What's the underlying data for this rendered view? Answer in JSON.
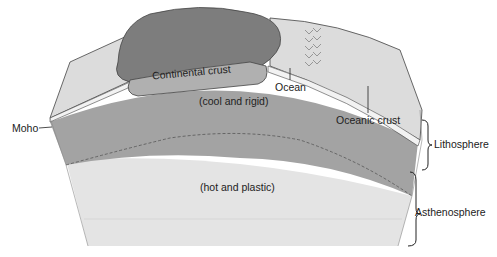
{
  "labels": {
    "continental_crust": "Continental crust",
    "ocean": "Ocean",
    "cool_rigid": "(cool and rigid)",
    "oceanic_crust": "Oceanic crust",
    "moho": "Moho",
    "lithosphere": "Lithosphere",
    "hot_plastic": "(hot and plastic)",
    "asthenosphere": "Asthenosphere"
  },
  "colors": {
    "background": "#ffffff",
    "lithosphere_mantle": "#a3a3a3",
    "asthenosphere": "#e4e4e4",
    "continent_surface": "#7d7d7d",
    "continental_crust": "#b0b0b0",
    "ocean_floor_surface": "#d9d9d9",
    "outline": "#333333"
  }
}
